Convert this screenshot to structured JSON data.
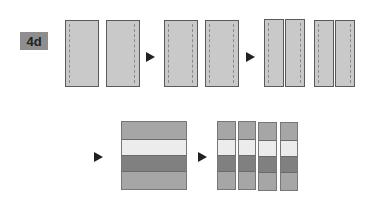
{
  "step_label": "4d",
  "colors": {
    "fabric": "#c9c9c9",
    "stripe_mid": "#a6a6a6",
    "stripe_light": "#ececec",
    "stripe_dark": "#808080",
    "arrow": "#222222",
    "label_bg": "#8e8e8e"
  },
  "top_row": {
    "stages": [
      {
        "name": "two panels, seam on one edge",
        "panels": 2,
        "seams": "one-side"
      },
      {
        "name": "two panels, seams on both edges",
        "panels": 2,
        "seams": "both-sides"
      },
      {
        "name": "four narrow strips",
        "panels": 4,
        "seams": "both-sides"
      }
    ]
  },
  "bottom_row": {
    "strip_set_stripes": [
      "mid",
      "light",
      "dark",
      "mid"
    ],
    "cut_segments": 4
  }
}
